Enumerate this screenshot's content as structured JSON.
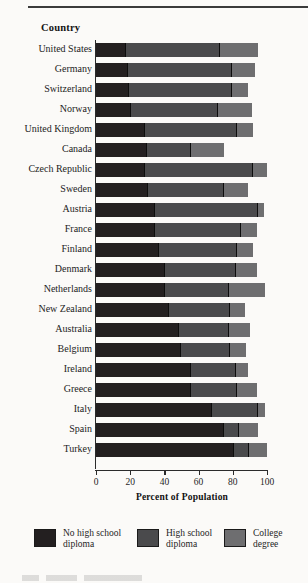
{
  "header": {
    "column_title": "Country"
  },
  "chart_data": {
    "type": "bar",
    "orientation": "horizontal",
    "stacked": true,
    "title": "",
    "xlabel": "Percent of Population",
    "ylabel": "Country",
    "xlim": [
      0,
      100
    ],
    "xticks": [
      0,
      20,
      40,
      60,
      80,
      100
    ],
    "xticklabels": [
      "0",
      "20",
      "40",
      "60",
      "80",
      "100"
    ],
    "grid": false,
    "legend_position": "bottom",
    "categories": [
      "United States",
      "Germany",
      "Switzerland",
      "Norway",
      "United Kingdom",
      "Canada",
      "Czech Republic",
      "Sweden",
      "Austria",
      "France",
      "Finland",
      "Denmark",
      "Netherlands",
      "New Zealand",
      "Australia",
      "Belgium",
      "Ireland",
      "Greece",
      "Italy",
      "Spain",
      "Turkey"
    ],
    "series": [
      {
        "name": "No high school diploma",
        "color": "#231f20",
        "values": [
          17,
          18,
          19,
          20,
          28,
          29,
          28,
          30,
          34,
          34,
          36,
          40,
          40,
          42,
          48,
          49,
          55,
          55,
          67,
          74,
          80
        ]
      },
      {
        "name": "High school diploma",
        "color": "#4a4a4c",
        "values": [
          55,
          61,
          60,
          51,
          54,
          26,
          63,
          44,
          60,
          50,
          46,
          41,
          37,
          36,
          29,
          29,
          26,
          27,
          27,
          9,
          9
        ]
      },
      {
        "name": "College degree",
        "color": "#6e6e70",
        "values": [
          23,
          14,
          10,
          20,
          10,
          20,
          9,
          15,
          4,
          10,
          10,
          13,
          22,
          9,
          13,
          10,
          8,
          12,
          5,
          12,
          11
        ]
      }
    ],
    "cumulative_ends": [
      [
        17,
        72,
        95
      ],
      [
        18,
        79,
        93
      ],
      [
        19,
        79,
        89
      ],
      [
        20,
        71,
        91
      ],
      [
        28,
        82,
        92
      ],
      [
        29,
        55,
        75
      ],
      [
        28,
        91,
        100
      ],
      [
        30,
        74,
        89
      ],
      [
        34,
        94,
        98
      ],
      [
        34,
        84,
        94
      ],
      [
        36,
        82,
        92
      ],
      [
        40,
        81,
        94
      ],
      [
        40,
        77,
        99
      ],
      [
        42,
        78,
        87
      ],
      [
        48,
        77,
        90
      ],
      [
        49,
        78,
        88
      ],
      [
        55,
        81,
        89
      ],
      [
        55,
        82,
        94
      ],
      [
        67,
        94,
        99
      ],
      [
        74,
        83,
        95
      ],
      [
        80,
        89,
        100
      ]
    ]
  },
  "legend": [
    {
      "label": "No high school\ndiploma",
      "color": "#231f20"
    },
    {
      "label": "High school\ndiploma",
      "color": "#4a4a4c"
    },
    {
      "label": "College\ndegree",
      "color": "#6e6e70"
    }
  ]
}
